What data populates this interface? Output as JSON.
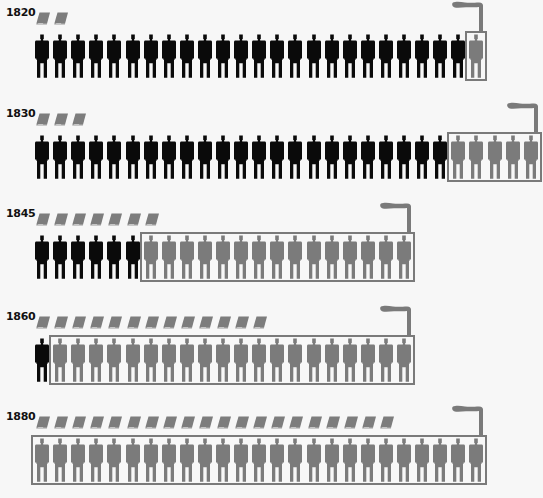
{
  "chart_data": {
    "type": "table",
    "title": "",
    "legend": [
      {
        "symbol": "book",
        "meaning": "unit of output"
      },
      {
        "symbol": "black-figure",
        "meaning": "worker outside factory"
      },
      {
        "symbol": "grey-figure-in-factory",
        "meaning": "factory worker"
      }
    ],
    "categories": [
      "1820",
      "1830",
      "1845",
      "1860",
      "1880"
    ],
    "series": [
      {
        "name": "books",
        "values": [
          2,
          3,
          7,
          13,
          20
        ]
      },
      {
        "name": "black_figures",
        "values": [
          24,
          23,
          6,
          1,
          0
        ]
      },
      {
        "name": "grey_figures_factory",
        "values": [
          1,
          5,
          15,
          20,
          25
        ]
      }
    ]
  },
  "rows": [
    {
      "year": "1820",
      "books": 2,
      "black": 24,
      "grey": 1
    },
    {
      "year": "1830",
      "books": 3,
      "black": 23,
      "grey": 5
    },
    {
      "year": "1845",
      "books": 7,
      "black": 6,
      "grey": 15
    },
    {
      "year": "1860",
      "books": 13,
      "black": 1,
      "grey": 20
    },
    {
      "year": "1880",
      "books": 20,
      "black": 0,
      "grey": 25
    }
  ],
  "colors": {
    "black_figure": "#0a0a0a",
    "grey_figure": "#7b7b7b",
    "book": "#7d7d7d",
    "factory_outline": "#7a7a7a",
    "background": "#f7f7f7"
  }
}
